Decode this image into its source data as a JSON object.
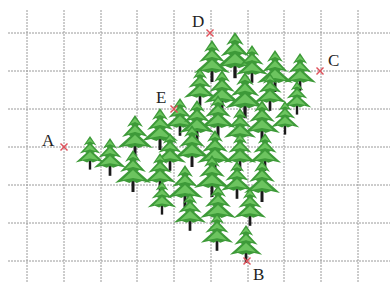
{
  "figure": {
    "width": 390,
    "height": 288,
    "grid": {
      "x_lines": [
        27,
        64,
        101,
        137,
        174,
        211,
        248,
        284,
        321,
        358
      ],
      "y_lines": [
        33,
        71,
        109,
        147,
        185,
        223,
        261
      ],
      "x_start": 8,
      "x_end": 390,
      "y_start": 10,
      "y_end": 282,
      "color": "#9a9a9a"
    },
    "points": [
      {
        "label": "A",
        "x": 64,
        "y": 147,
        "label_x": 42,
        "label_y": 146
      },
      {
        "label": "B",
        "x": 247,
        "y": 261,
        "label_x": 253,
        "label_y": 280
      },
      {
        "label": "C",
        "x": 320,
        "y": 71,
        "label_x": 328,
        "label_y": 66
      },
      {
        "label": "D",
        "x": 210,
        "y": 33,
        "label_x": 192,
        "label_y": 27
      },
      {
        "label": "E",
        "x": 174,
        "y": 109,
        "label_x": 156,
        "label_y": 103
      }
    ],
    "marker_color": "#e0505a",
    "tree_colors": {
      "dark": "#3d9a38",
      "light": "#6cc45f",
      "trunk": "#1a1a1a"
    },
    "trees": [
      {
        "x": 212,
        "y": 70,
        "s": 1.0
      },
      {
        "x": 235,
        "y": 65,
        "s": 1.1
      },
      {
        "x": 252,
        "y": 72,
        "s": 0.9
      },
      {
        "x": 275,
        "y": 80,
        "s": 1.0
      },
      {
        "x": 300,
        "y": 80,
        "s": 0.9
      },
      {
        "x": 200,
        "y": 95,
        "s": 0.9
      },
      {
        "x": 222,
        "y": 100,
        "s": 1.0
      },
      {
        "x": 245,
        "y": 105,
        "s": 1.1
      },
      {
        "x": 270,
        "y": 100,
        "s": 0.9
      },
      {
        "x": 297,
        "y": 105,
        "s": 0.8
      },
      {
        "x": 180,
        "y": 125,
        "s": 0.9
      },
      {
        "x": 197,
        "y": 130,
        "s": 1.0
      },
      {
        "x": 218,
        "y": 125,
        "s": 1.0
      },
      {
        "x": 240,
        "y": 135,
        "s": 0.9
      },
      {
        "x": 262,
        "y": 130,
        "s": 1.0
      },
      {
        "x": 285,
        "y": 125,
        "s": 0.8
      },
      {
        "x": 90,
        "y": 160,
        "s": 0.8
      },
      {
        "x": 110,
        "y": 165,
        "s": 0.9
      },
      {
        "x": 135,
        "y": 145,
        "s": 1.0
      },
      {
        "x": 160,
        "y": 138,
        "s": 1.0
      },
      {
        "x": 170,
        "y": 160,
        "s": 0.9
      },
      {
        "x": 192,
        "y": 155,
        "s": 1.0
      },
      {
        "x": 215,
        "y": 160,
        "s": 1.0
      },
      {
        "x": 240,
        "y": 160,
        "s": 0.9
      },
      {
        "x": 265,
        "y": 160,
        "s": 0.9
      },
      {
        "x": 133,
        "y": 180,
        "s": 1.0
      },
      {
        "x": 160,
        "y": 180,
        "s": 0.9
      },
      {
        "x": 185,
        "y": 195,
        "s": 1.0
      },
      {
        "x": 212,
        "y": 185,
        "s": 1.0
      },
      {
        "x": 237,
        "y": 188,
        "s": 0.9
      },
      {
        "x": 262,
        "y": 190,
        "s": 1.0
      },
      {
        "x": 162,
        "y": 205,
        "s": 0.8
      },
      {
        "x": 190,
        "y": 220,
        "s": 0.9
      },
      {
        "x": 218,
        "y": 215,
        "s": 1.0
      },
      {
        "x": 250,
        "y": 215,
        "s": 0.9
      },
      {
        "x": 217,
        "y": 240,
        "s": 0.9
      },
      {
        "x": 246,
        "y": 252,
        "s": 0.9
      }
    ]
  }
}
